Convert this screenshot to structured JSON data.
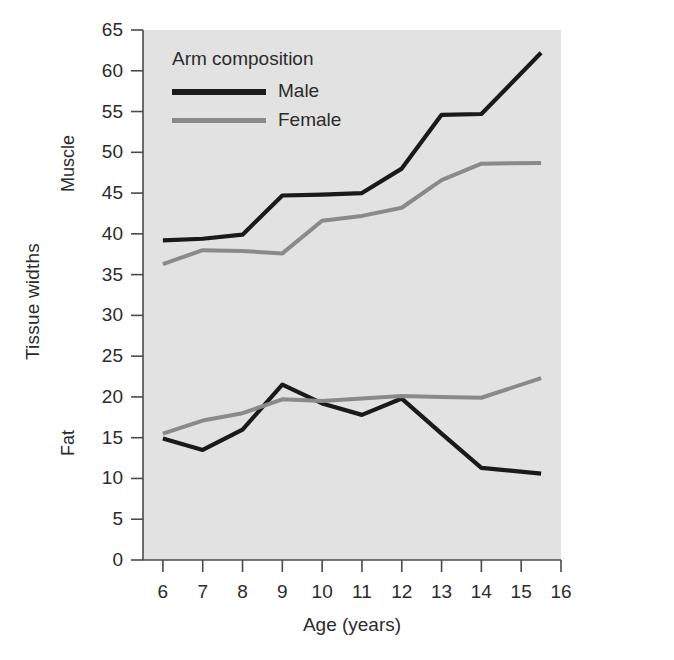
{
  "figure": {
    "background_color": "#ffffff",
    "plot_background_color": "#e2e2e2",
    "axis_color": "#4a4a4a"
  },
  "legend": {
    "title": "Arm composition",
    "entries": [
      {
        "label": "Male",
        "color": "#1a1a1a"
      },
      {
        "label": "Female",
        "color": "#8a8a8a"
      }
    ],
    "position": "top-left-inside"
  },
  "axes": {
    "y_title": "Tissue widths",
    "y_band_upper": "Muscle",
    "y_band_lower": "Fat",
    "x_title": "Age (years)",
    "y_ticks": [
      "0",
      "5",
      "10",
      "15",
      "20",
      "25",
      "30",
      "35",
      "40",
      "45",
      "50",
      "55",
      "60",
      "65"
    ],
    "x_ticks": [
      "6",
      "7",
      "8",
      "9",
      "10",
      "11",
      "12",
      "13",
      "14",
      "15",
      "16"
    ]
  },
  "chart_data": {
    "type": "line",
    "title": "Arm composition",
    "xlabel": "Age (years)",
    "ylabel": "Tissue widths",
    "xlim": [
      5.5,
      16
    ],
    "ylim": [
      0,
      65
    ],
    "grid": false,
    "legend_position": "top-left-inside",
    "x": [
      6,
      7,
      8,
      9,
      10,
      11,
      12,
      13,
      14,
      15.5
    ],
    "series": [
      {
        "name": "Male",
        "tissue": "Muscle",
        "color": "#1a1a1a",
        "values": [
          39.2,
          39.4,
          39.9,
          44.7,
          44.8,
          45.0,
          48.0,
          54.6,
          54.7,
          62.2
        ]
      },
      {
        "name": "Female",
        "tissue": "Muscle",
        "color": "#8a8a8a",
        "values": [
          36.3,
          38.0,
          37.9,
          37.6,
          41.6,
          42.2,
          43.2,
          46.6,
          48.6,
          48.7
        ]
      },
      {
        "name": "Male",
        "tissue": "Fat",
        "color": "#1a1a1a",
        "values": [
          14.9,
          13.5,
          16.0,
          21.5,
          19.2,
          17.8,
          19.8,
          15.5,
          11.3,
          10.6
        ]
      },
      {
        "name": "Female",
        "tissue": "Fat",
        "color": "#8a8a8a",
        "values": [
          15.5,
          17.1,
          18.0,
          19.7,
          19.5,
          19.8,
          20.1,
          20.0,
          19.9,
          22.3
        ]
      }
    ]
  }
}
